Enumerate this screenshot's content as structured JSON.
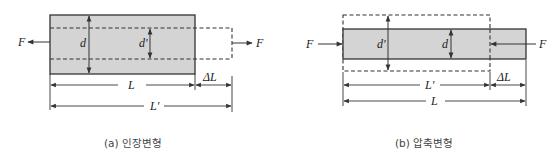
{
  "figure": {
    "panels": [
      {
        "id": "a",
        "caption": "(a) 인장변형",
        "type": "tension",
        "labels": {
          "force_left": "F",
          "force_right": "F",
          "original_diameter": "d",
          "deformed_diameter": "d'",
          "original_length": "L",
          "elongation": "ΔL",
          "deformed_length": "L'"
        }
      },
      {
        "id": "b",
        "caption": "(b) 압축변형",
        "type": "compression",
        "labels": {
          "force_left": "F",
          "force_right": "F",
          "deformed_diameter": "d'",
          "original_diameter": "d",
          "deformed_length": "L'",
          "contraction": "ΔL",
          "original_length": "L"
        }
      }
    ],
    "colors": {
      "bar_fill": "#d4d4d4",
      "stroke": "#333333",
      "dashed": "#333333",
      "text": "#222222",
      "caption": "#444444"
    }
  }
}
